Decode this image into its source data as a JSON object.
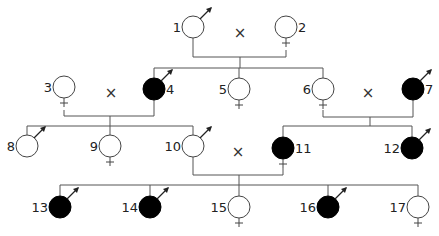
{
  "diagram": {
    "type": "pedigree",
    "colors": {
      "affected": "#000000",
      "unaffected": "#ffffff",
      "line": "#555555"
    },
    "mating_symbol": "×",
    "individuals": [
      {
        "id": "1",
        "sex": "male",
        "affected": false,
        "x": 193,
        "y": 27
      },
      {
        "id": "2",
        "sex": "female",
        "affected": false,
        "x": 286,
        "y": 27
      },
      {
        "id": "3",
        "sex": "female",
        "affected": false,
        "x": 64,
        "y": 87
      },
      {
        "id": "4",
        "sex": "male",
        "affected": true,
        "x": 154,
        "y": 89
      },
      {
        "id": "5",
        "sex": "female",
        "affected": false,
        "x": 239,
        "y": 89
      },
      {
        "id": "6",
        "sex": "female",
        "affected": false,
        "x": 323,
        "y": 89
      },
      {
        "id": "7",
        "sex": "male",
        "affected": true,
        "x": 413,
        "y": 89
      },
      {
        "id": "8",
        "sex": "male",
        "affected": false,
        "x": 27,
        "y": 146
      },
      {
        "id": "9",
        "sex": "female",
        "affected": false,
        "x": 110,
        "y": 146
      },
      {
        "id": "10",
        "sex": "male",
        "affected": false,
        "x": 193,
        "y": 146
      },
      {
        "id": "11",
        "sex": "female",
        "affected": true,
        "x": 283,
        "y": 148
      },
      {
        "id": "12",
        "sex": "male",
        "affected": true,
        "x": 412,
        "y": 148
      },
      {
        "id": "13",
        "sex": "male",
        "affected": true,
        "x": 60,
        "y": 207
      },
      {
        "id": "14",
        "sex": "male",
        "affected": true,
        "x": 150,
        "y": 207
      },
      {
        "id": "15",
        "sex": "female",
        "affected": false,
        "x": 239,
        "y": 207
      },
      {
        "id": "16",
        "sex": "male",
        "affected": true,
        "x": 328,
        "y": 207
      },
      {
        "id": "17",
        "sex": "female",
        "affected": false,
        "x": 418,
        "y": 207
      }
    ],
    "matings": [
      {
        "partners": [
          "1",
          "2"
        ],
        "cross_x": 240,
        "cross_y": 33
      },
      {
        "partners": [
          "3",
          "4"
        ],
        "cross_x": 111,
        "cross_y": 93
      },
      {
        "partners": [
          "6",
          "7"
        ],
        "cross_x": 368,
        "cross_y": 93
      },
      {
        "partners": [
          "10",
          "11"
        ],
        "cross_x": 238,
        "cross_y": 152
      }
    ]
  }
}
